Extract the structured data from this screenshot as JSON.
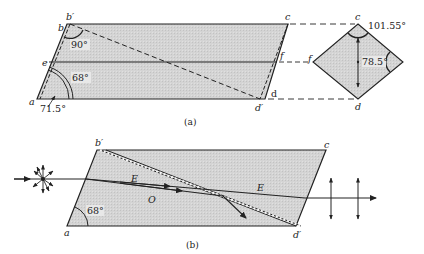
{
  "figure_a": {
    "caption": "(a)",
    "vertices": {
      "a": "a",
      "b": "b",
      "b_prime": "b′",
      "c": "c",
      "d": "d",
      "d_prime": "d′",
      "e": "e",
      "f": "f"
    },
    "angles": {
      "top_left": "90°",
      "inner": "68°",
      "outer": "71.5°"
    },
    "section": {
      "c": "c",
      "f": "f",
      "d": "d",
      "top_angle": "101.55°",
      "side_angle": "78.5°"
    }
  },
  "figure_b": {
    "caption": "(b)",
    "vertices": {
      "a": "a",
      "b_prime": "b′",
      "c": "c",
      "d_prime": "d′"
    },
    "angle": "68°",
    "rays": {
      "extraordinary": "E",
      "ordinary": "O",
      "exit": "E"
    }
  },
  "colors": {
    "fill": "#d2d2d2",
    "line": "#222222"
  }
}
